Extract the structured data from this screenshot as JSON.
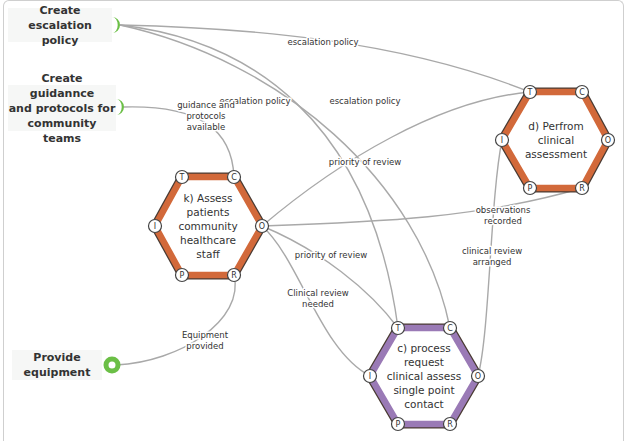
{
  "diagram": {
    "type": "FRAM functional resonance diagram",
    "colors": {
      "edge": "#a9a9a9",
      "hex_orange": "#d2693a",
      "hex_purple": "#9a7ab6",
      "hex_outline": "#4a3b33",
      "input_green": "#6bbf46",
      "input_box_bg": "#f6f7f6"
    },
    "inputs": [
      {
        "id": "escalation",
        "label": "Create escalation policy",
        "lines": [
          "Create escalation",
          "policy"
        ],
        "x": 8,
        "y": 8,
        "w": 104,
        "h": 34,
        "connector": "half-circle",
        "cx": 116,
        "cy": 25
      },
      {
        "id": "guidance",
        "label": "Create guidannce and protocols for community teams",
        "lines": [
          "Create guidannce",
          "and protocols for",
          "community teams"
        ],
        "x": 8,
        "y": 85,
        "w": 108,
        "h": 46,
        "connector": "half-circle",
        "cx": 120,
        "cy": 107
      },
      {
        "id": "equipment",
        "label": "Provide equipment",
        "lines": [
          "Provide",
          "equipment"
        ],
        "x": 12,
        "y": 350,
        "w": 90,
        "h": 30,
        "connector": "ring",
        "cx": 112,
        "cy": 365
      }
    ],
    "functions": [
      {
        "id": "k",
        "color": "orange",
        "cx": 208,
        "cy": 226,
        "lines": [
          "k) Assess",
          "patients",
          "community",
          "healthcare",
          "staff"
        ],
        "ports": {
          "T": [
            182,
            177
          ],
          "C": [
            234,
            177
          ],
          "O": [
            262,
            226
          ],
          "R": [
            234,
            275
          ],
          "P": [
            182,
            275
          ],
          "I": [
            155,
            226
          ]
        }
      },
      {
        "id": "d",
        "color": "orange",
        "cx": 556,
        "cy": 140,
        "lines": [
          "d) Perfrom",
          "clinical",
          "assessment"
        ],
        "ports": {
          "T": [
            530,
            92
          ],
          "C": [
            582,
            92
          ],
          "O": [
            608,
            140
          ],
          "R": [
            582,
            188
          ],
          "P": [
            530,
            188
          ],
          "I": [
            502,
            140
          ]
        }
      },
      {
        "id": "c",
        "color": "purple",
        "cx": 424,
        "cy": 376,
        "lines": [
          "c) process",
          "request",
          "clinical assess",
          "single point",
          "contact"
        ],
        "ports": {
          "T": [
            398,
            328
          ],
          "C": [
            450,
            328
          ],
          "O": [
            478,
            376
          ],
          "R": [
            450,
            424
          ],
          "P": [
            398,
            424
          ],
          "I": [
            370,
            376
          ]
        }
      }
    ],
    "edges": [
      {
        "path": "M120,25 C250,28 400,40 530,92"
      },
      {
        "path": "M120,25 C250,40 370,120 398,328"
      },
      {
        "path": "M120,25 C280,60 420,180 450,328"
      },
      {
        "path": "M124,107 C200,105 232,130 234,177"
      },
      {
        "path": "M262,226 C340,160 440,100 530,92"
      },
      {
        "path": "M262,226 C380,222 480,218 582,188"
      },
      {
        "path": "M262,226 C320,250 370,290 398,328"
      },
      {
        "path": "M262,226 C300,260 320,350 370,376"
      },
      {
        "path": "M502,140 C490,200 490,330 478,376"
      },
      {
        "path": "M234,275 C245,320 180,362 116,365"
      }
    ],
    "edge_labels": [
      {
        "text": [
          "escalation policy"
        ],
        "x": 323,
        "y": 42
      },
      {
        "text": [
          "escalation policy"
        ],
        "x": 255,
        "y": 101
      },
      {
        "text": [
          "escalation policy"
        ],
        "x": 365,
        "y": 101
      },
      {
        "text": [
          "guidance and",
          "protocols",
          "available"
        ],
        "x": 206,
        "y": 116
      },
      {
        "text": [
          "priority of review"
        ],
        "x": 365,
        "y": 162
      },
      {
        "text": [
          "observations",
          "recorded"
        ],
        "x": 503,
        "y": 215
      },
      {
        "text": [
          "priority of review"
        ],
        "x": 331,
        "y": 255
      },
      {
        "text": [
          "clinical review",
          "arranged"
        ],
        "x": 492,
        "y": 256
      },
      {
        "text": [
          "Clinical review",
          "needed"
        ],
        "x": 318,
        "y": 298
      },
      {
        "text": [
          "Equipment",
          "provided"
        ],
        "x": 205,
        "y": 340
      }
    ]
  }
}
